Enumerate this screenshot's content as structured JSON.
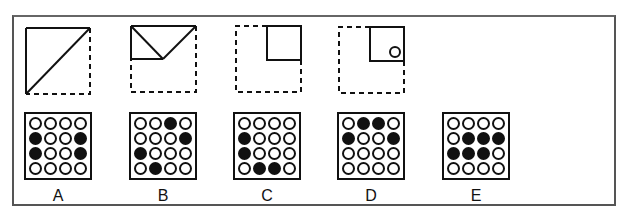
{
  "folding_steps": [
    {
      "step": 1,
      "description": "square folded along diagonal; top-left triangle solid, bottom-right dashed"
    },
    {
      "step": 2,
      "description": "triangle folded again; small triangles at top, dashed square outline"
    },
    {
      "step": 3,
      "description": "folded to small square at top-right inside dashed square"
    },
    {
      "step": 4,
      "description": "small square with hole punched near bottom-right inside dashed square"
    }
  ],
  "options": [
    {
      "label": "A",
      "grid": [
        [
          0,
          0,
          0,
          0
        ],
        [
          1,
          0,
          0,
          1
        ],
        [
          1,
          0,
          0,
          1
        ],
        [
          0,
          0,
          0,
          0
        ]
      ]
    },
    {
      "label": "B",
      "grid": [
        [
          0,
          0,
          1,
          0
        ],
        [
          0,
          0,
          0,
          1
        ],
        [
          1,
          0,
          0,
          0
        ],
        [
          0,
          1,
          0,
          0
        ]
      ]
    },
    {
      "label": "C",
      "grid": [
        [
          0,
          0,
          0,
          0
        ],
        [
          1,
          0,
          0,
          0
        ],
        [
          1,
          0,
          0,
          0
        ],
        [
          0,
          1,
          1,
          0
        ]
      ]
    },
    {
      "label": "D",
      "grid": [
        [
          0,
          1,
          1,
          0
        ],
        [
          1,
          0,
          0,
          1
        ],
        [
          0,
          0,
          0,
          0
        ],
        [
          0,
          0,
          0,
          0
        ]
      ]
    },
    {
      "label": "E",
      "grid": [
        [
          0,
          0,
          0,
          0
        ],
        [
          0,
          1,
          1,
          1
        ],
        [
          1,
          1,
          1,
          0
        ],
        [
          0,
          0,
          0,
          0
        ]
      ]
    }
  ],
  "colors": {
    "stroke": "#111111",
    "frame": "#555555",
    "background": "#ffffff"
  }
}
